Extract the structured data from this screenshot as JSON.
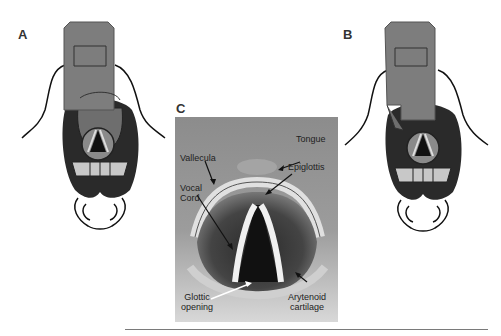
{
  "panels": {
    "a": {
      "label": "A"
    },
    "b": {
      "label": "B"
    },
    "c": {
      "label": "C"
    }
  },
  "annotations": {
    "tongue": "Tongue",
    "vallecula": "Vallecula",
    "epiglottis": "Epiglottis",
    "vocal_cord_line1": "Vocal",
    "vocal_cord_line2": "Cord",
    "glottic_line1": "Glottic",
    "glottic_line2": "opening",
    "arytenoid_line1": "Arytenoid",
    "arytenoid_line2": "cartilage"
  },
  "colors": {
    "blade_gray": "#7d7d7d",
    "mouth_dark": "#2a2a2a",
    "photo_bg": "#9a9a9a",
    "teeth": "#c8c8c8"
  }
}
